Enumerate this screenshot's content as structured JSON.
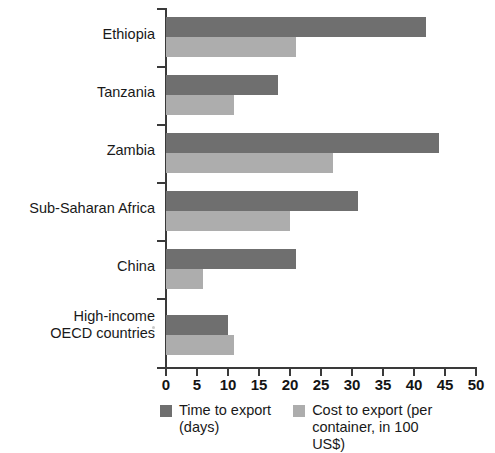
{
  "chart_data": {
    "type": "bar",
    "orientation": "horizontal",
    "title": "",
    "xlabel": "",
    "ylabel": "",
    "xlim": [
      0,
      50
    ],
    "xticks": [
      0,
      5,
      10,
      15,
      20,
      25,
      30,
      35,
      40,
      45,
      50
    ],
    "grid": false,
    "legend_position": "bottom",
    "categories": [
      "Ethiopia",
      "Tanzania",
      "Zambia",
      "Sub-Saharan Africa",
      "China",
      "High-income\nOECD countries"
    ],
    "series": [
      {
        "name": "Time to export (days)",
        "color": "#6f6f6f",
        "values": [
          42,
          18,
          44,
          31,
          21,
          10
        ]
      },
      {
        "name": "Cost to export (per container, in 100 US$)",
        "color": "#adadad",
        "values": [
          21,
          11,
          27,
          20,
          6,
          11
        ]
      }
    ]
  },
  "categories": [
    {
      "line1": "Ethiopia",
      "line2": ""
    },
    {
      "line1": "Tanzania",
      "line2": ""
    },
    {
      "line1": "Zambia",
      "line2": ""
    },
    {
      "line1": "Sub-Saharan Africa",
      "line2": ""
    },
    {
      "line1": "China",
      "line2": ""
    },
    {
      "line1": "High-income",
      "line2": "OECD countries"
    }
  ],
  "xticks": [
    {
      "label": "0"
    },
    {
      "label": "5"
    },
    {
      "label": "10"
    },
    {
      "label": "15"
    },
    {
      "label": "20"
    },
    {
      "label": "25"
    },
    {
      "label": "30"
    },
    {
      "label": "35"
    },
    {
      "label": "40"
    },
    {
      "label": "45"
    },
    {
      "label": "50"
    }
  ],
  "legend": [
    {
      "line1": "Time to export",
      "line2": "(days)",
      "color": "#6f6f6f"
    },
    {
      "line1": "Cost to export (per",
      "line2": "container, in 100 US$)",
      "color": "#adadad"
    }
  ]
}
